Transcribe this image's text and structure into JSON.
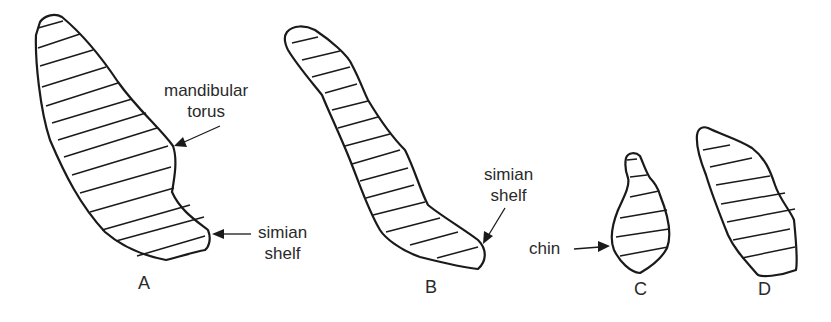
{
  "figure": {
    "panels": [
      {
        "id": "A",
        "label": "A"
      },
      {
        "id": "B",
        "label": "B"
      },
      {
        "id": "C",
        "label": "C"
      },
      {
        "id": "D",
        "label": "D"
      }
    ],
    "annotations": {
      "a_torus_line1": "mandibular",
      "a_torus_line2": "torus",
      "a_shelf_line1": "simian",
      "a_shelf_line2": "shelf",
      "b_shelf_line1": "simian",
      "b_shelf_line2": "shelf",
      "c_chin": "chin"
    },
    "colors": {
      "ink": "#1a1a1a",
      "background": "#ffffff"
    }
  }
}
